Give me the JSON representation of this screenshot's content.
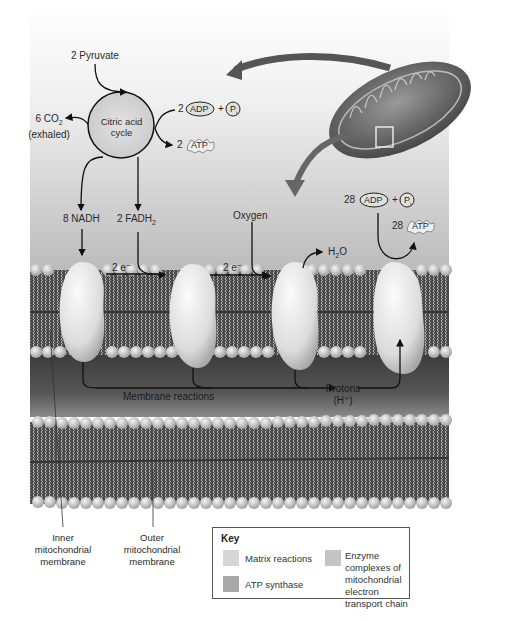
{
  "diagram": {
    "colors": {
      "matrix_bg_top": "#ffffff",
      "matrix_bg_bottom": "#b9b9b9",
      "intermembrane": "#4a4a4a",
      "membrane_tail": "#5a5a5a",
      "head_bead": "#d9d9d9",
      "enzyme": "#e6e6e6",
      "arrow": "#111111",
      "mito_arrow": "#555555"
    },
    "citric_cycle": {
      "label_line1": "Citric acid",
      "label_line2": "cycle",
      "input": "2 Pyruvate",
      "co2_line1": "6 CO",
      "co2_sub": "2",
      "co2_line2": "(exhaled)",
      "adp_coeff": "2",
      "adp": "ADP",
      "plus": "+",
      "pi": "P",
      "pi_sub": "i",
      "atp_coeff": "2",
      "atp": "ATP"
    },
    "carriers": {
      "nadh": "8 NADH",
      "fadh_prefix": "2 FADH",
      "fadh_sub": "2",
      "electrons_1": "2 e⁻",
      "electrons_2": "2 e⁻",
      "oxygen": "Oxygen",
      "water_h": "H",
      "water_sub": "2",
      "water_o": "O"
    },
    "atp_synthase": {
      "adp_coeff": "28",
      "adp": "ADP",
      "plus": "+",
      "pi": "P",
      "pi_sub": "i",
      "atp_coeff": "28",
      "atp": "ATP"
    },
    "membrane": {
      "reactions_label": "Membrane reactions",
      "protons_line1": "Protons",
      "protons_line2": "(H⁺)"
    },
    "callouts": {
      "inner_line1": "Inner",
      "inner_line2": "mitochondrial",
      "inner_line3": "membrane",
      "outer_line1": "Outer",
      "outer_line2": "mitochondrial",
      "outer_line3": "membrane"
    },
    "key": {
      "title": "Key",
      "items": [
        {
          "label": "Matrix reactions",
          "color": "#d6d6d6"
        },
        {
          "label": "ATP synthase",
          "color": "#a9a9a9"
        },
        {
          "label_line1": "Enzyme complexes of",
          "label_line2": "mitochondrial electron",
          "label_line3": "transport chain",
          "color": "#c4c4c4"
        }
      ]
    }
  }
}
